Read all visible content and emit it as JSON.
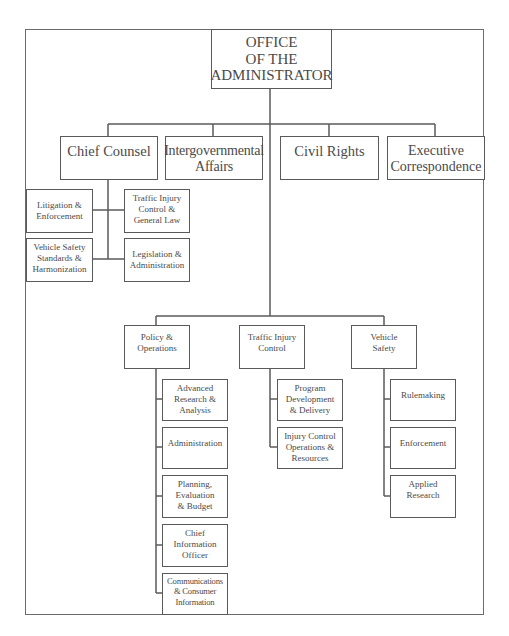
{
  "chart": {
    "root": {
      "label": "OFFICE\nOF THE\nADMINISTRATOR"
    },
    "level1": [
      {
        "id": "chief-counsel",
        "label": "Chief Counsel"
      },
      {
        "id": "intergovernmental-affairs",
        "label": "Intergovernmental\nAffairs"
      },
      {
        "id": "civil-rights",
        "label": "Civil Rights"
      },
      {
        "id": "executive-correspondence",
        "label": "Executive\nCorrespondence"
      }
    ],
    "chief_counsel_children": [
      {
        "id": "litigation-enforcement",
        "label": "Litigation &\nEnforcement"
      },
      {
        "id": "traffic-injury-control-general-law",
        "label": "Traffic Injury\nControl &\nGeneral Law"
      },
      {
        "id": "vehicle-safety-standards-harmonization",
        "label": "Vehicle Safety\nStandards &\nHarmonization"
      },
      {
        "id": "legislation-administration",
        "label": "Legislation &\nAdministration"
      }
    ],
    "level2": [
      {
        "id": "policy-operations",
        "label": "Policy &\nOperations",
        "children": [
          {
            "label": "Advanced\nResearch &\nAnalysis"
          },
          {
            "label": "Administration"
          },
          {
            "label": "Planning,\nEvaluation\n& Budget"
          },
          {
            "label": "Chief\nInformation\nOfficer"
          },
          {
            "label": "Communications\n& Consumer\nInformation"
          }
        ]
      },
      {
        "id": "traffic-injury-control",
        "label": "Traffic Injury\nControl",
        "children": [
          {
            "label": "Program\nDevelopment\n& Delivery"
          },
          {
            "label": "Injury Control\nOperations &\nResources"
          }
        ]
      },
      {
        "id": "vehicle-safety",
        "label": "Vehicle\nSafety",
        "children": [
          {
            "label": "Rulemaking"
          },
          {
            "label": "Enforcement"
          },
          {
            "label": "Applied\nResearch"
          }
        ]
      }
    ],
    "colors": {
      "line": "#5a5a5a",
      "text": "#4a4a4a",
      "background": "#ffffff"
    }
  }
}
